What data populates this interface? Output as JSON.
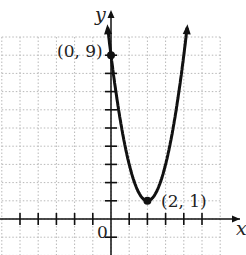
{
  "chart_data": {
    "type": "line",
    "title": "",
    "xlabel": "x",
    "ylabel": "y",
    "origin_label": "0",
    "function": "y = 2(x-2)^2 + 1",
    "xlim": [
      -6,
      6
    ],
    "ylim": [
      -2,
      10
    ],
    "grid": true,
    "points": [
      {
        "x": 0,
        "y": 9,
        "label": "(0, 9)"
      },
      {
        "x": 2,
        "y": 1,
        "label": "(2, 1)"
      }
    ],
    "series": [
      {
        "name": "parabola",
        "x": [
          -0.2,
          0,
          0.5,
          1,
          1.5,
          2,
          2.5,
          3,
          3.5,
          4,
          4.2
        ],
        "values": [
          10.68,
          9,
          5.5,
          3,
          1.5,
          1,
          1.5,
          3,
          5.5,
          9,
          10.68
        ]
      }
    ],
    "legend": []
  },
  "labels": {
    "x_axis": "x",
    "y_axis": "y",
    "origin": "0",
    "point_a": "(0, 9)",
    "point_b": "(2, 1)"
  }
}
